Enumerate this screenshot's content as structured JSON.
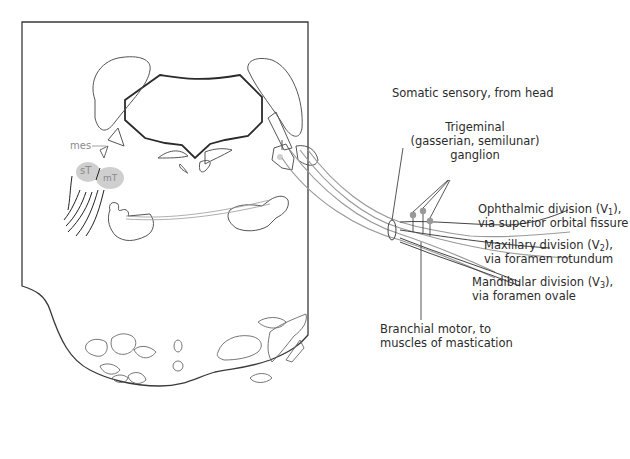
{
  "diagram": {
    "colors": {
      "outline": "#3a3a3a",
      "nerve_gray": "#a8a8a8",
      "nucleus_fill": "#cfcfcf",
      "label_text": "#2b2b2b",
      "nucleus_label": "#8a8a8a"
    },
    "nucleus_labels": {
      "mes": "mes",
      "sT": "sT",
      "mT": "mT"
    },
    "labels": {
      "somatic_sensory": "Somatic sensory, from head",
      "ganglion_line1": "Trigeminal",
      "ganglion_line2": "(gasserian, semilunar)",
      "ganglion_line3": "ganglion",
      "ophthalmic_line1_pre": "Ophthalmic division (V",
      "ophthalmic_sub": "1",
      "ophthalmic_line1_post": "),",
      "ophthalmic_line2": "via superior orbital fissure",
      "maxillary_line1_pre": "Maxillary division (V",
      "maxillary_sub": "2",
      "maxillary_line1_post": "),",
      "maxillary_line2": "via foramen rotundum",
      "mandibular_line1_pre": "Mandibular division (V",
      "mandibular_sub": "3",
      "mandibular_line1_post": "),",
      "mandibular_line2": "via foramen ovale",
      "branchial_line1": "Branchial motor, to",
      "branchial_line2": "muscles of mastication"
    }
  }
}
